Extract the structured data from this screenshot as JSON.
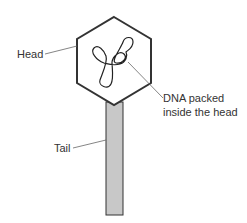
{
  "diagram": {
    "type": "bacteriophage structure",
    "labels": {
      "head": "Head",
      "dna_line1": "DNA packed",
      "dna_line2": "inside the head",
      "tail": "Tail"
    },
    "colors": {
      "outline": "#333333",
      "tail_fill": "#c8c8c8",
      "leader_line": "#666666",
      "background": "#ffffff"
    }
  }
}
